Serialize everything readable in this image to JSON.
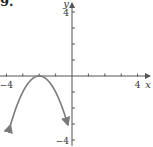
{
  "problem": {
    "number": "9."
  },
  "chart_data": {
    "type": "line",
    "title": "",
    "xlabel": "x",
    "ylabel": "y",
    "xlim": [
      -4.3,
      4.6
    ],
    "ylim": [
      -4.2,
      4.5
    ],
    "x_tick_labels": [
      {
        "value": -4,
        "label": "−4"
      },
      {
        "value": 4,
        "label": "4"
      }
    ],
    "y_tick_labels": [
      {
        "value": 4,
        "label": "4"
      },
      {
        "value": -4,
        "label": "−4"
      }
    ],
    "x_ticks": [
      -4,
      -3,
      -2,
      -1,
      1,
      2,
      3,
      4
    ],
    "y_ticks": [
      -4,
      -3,
      -2,
      -1,
      1,
      2,
      3,
      4
    ],
    "grid": false,
    "series": [
      {
        "name": "parabola",
        "equation": "y = -(x + 2)^2",
        "vertex": [
          -2,
          0
        ],
        "x": [
          -3.75,
          -3.5,
          -3,
          -2.5,
          -2,
          -1.5,
          -1,
          -0.5,
          -0.25
        ],
        "y": [
          -3.06,
          -2.25,
          -1,
          -0.25,
          0,
          -0.25,
          -1,
          -2.25,
          -3.06
        ],
        "arrows_on_ends": true,
        "color": "#7a7a7a"
      }
    ],
    "axis_color": "#555555"
  }
}
